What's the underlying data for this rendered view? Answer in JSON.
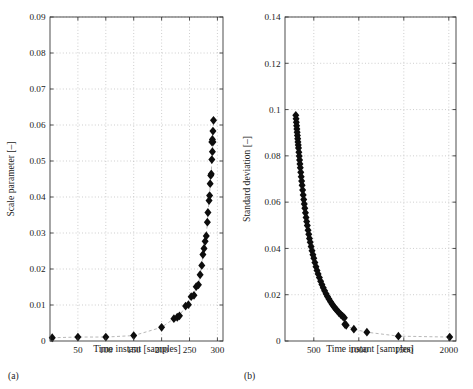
{
  "figure": {
    "background": "#ffffff",
    "marker_color": "#0d0d0d",
    "grid_color": "#b9b9b9",
    "axis_color": "#3a3a3a",
    "connector_color": "#9a9a9a"
  },
  "panels": [
    {
      "id": "a",
      "caption": "(a)",
      "xlabel": "Time instant [samples]",
      "ylabel": "Scale parameter [–]"
    },
    {
      "id": "b",
      "caption": "(b)",
      "xlabel": "Time instant [samples]",
      "ylabel": "Standard deviation [–]"
    }
  ],
  "chart_data": [
    {
      "type": "scatter",
      "id": "panel-a",
      "title": "",
      "subcaption": "(a)",
      "xlabel": "Time instant [samples]",
      "ylabel": "Scale parameter [–]",
      "xlim": [
        0,
        310
      ],
      "ylim": [
        0,
        0.09
      ],
      "xticks": [
        50,
        100,
        150,
        200,
        250,
        300
      ],
      "xtick_labels": [
        "50",
        "100",
        "150",
        "200",
        "250",
        "300"
      ],
      "yticks": [
        0,
        0.01,
        0.02,
        0.03,
        0.04,
        0.05,
        0.06,
        0.07,
        0.08,
        0.09
      ],
      "ytick_labels": [
        "0",
        "0.01",
        "0.02",
        "0.03",
        "0.04",
        "0.05",
        "0.06",
        "0.07",
        "0.08",
        "0.09"
      ],
      "grid": true,
      "legend": null,
      "marker": "diamond",
      "connector": "dashed",
      "series": [
        {
          "name": "Scale parameter",
          "x": [
            4,
            50,
            100,
            150,
            200,
            222,
            228,
            232,
            243,
            248,
            253,
            258,
            262,
            266,
            269,
            272,
            274,
            276,
            278,
            280,
            282,
            283,
            285,
            286,
            287,
            288,
            289,
            290,
            291,
            292
          ],
          "y": [
            0.0009,
            0.0011,
            0.0011,
            0.0015,
            0.0038,
            0.0062,
            0.0066,
            0.007,
            0.0097,
            0.0101,
            0.0123,
            0.0127,
            0.0151,
            0.0156,
            0.0184,
            0.021,
            0.024,
            0.0257,
            0.0277,
            0.0292,
            0.033,
            0.0357,
            0.039,
            0.0404,
            0.0437,
            0.046,
            0.0464,
            0.0504,
            0.0526,
            0.0553
          ]
        },
        {
          "name": "Scale parameter (upper tail)",
          "x": [
            290,
            291,
            292,
            293
          ],
          "y": [
            0.0553,
            0.056,
            0.0583,
            0.0613
          ]
        }
      ]
    },
    {
      "type": "scatter",
      "id": "panel-b",
      "title": "",
      "subcaption": "(b)",
      "xlabel": "Time instant [samples]",
      "ylabel": "Standard deviation [–]",
      "xlim": [
        180,
        2080
      ],
      "ylim": [
        0,
        0.14
      ],
      "xticks": [
        500,
        1000,
        1500,
        2000
      ],
      "xtick_labels": [
        "500",
        "1000",
        "1500",
        "2000"
      ],
      "yticks": [
        0,
        0.02,
        0.04,
        0.06,
        0.08,
        0.1,
        0.12,
        0.14
      ],
      "ytick_labels": [
        "0",
        "0.02",
        "0.04",
        "0.06",
        "0.08",
        "0.1",
        "0.12",
        "0.14"
      ],
      "grid": true,
      "legend": null,
      "marker": "diamond",
      "connector": "dashed",
      "series": [
        {
          "name": "Standard deviation (dense decay)",
          "x": [
            300,
            303,
            306,
            309,
            312,
            315,
            318,
            321,
            324,
            327,
            330,
            334,
            338,
            342,
            346,
            350,
            355,
            360,
            365,
            370,
            376,
            382,
            388,
            394,
            400,
            407,
            414,
            421,
            428,
            436,
            444,
            452,
            460,
            470,
            480,
            490,
            500,
            512,
            524,
            536,
            548,
            562,
            576,
            590,
            605,
            620,
            636,
            652,
            668,
            686,
            704,
            722,
            740,
            760,
            780,
            800,
            820,
            840
          ],
          "y": [
            0.0975,
            0.096,
            0.0945,
            0.093,
            0.0916,
            0.0902,
            0.0888,
            0.0874,
            0.086,
            0.0847,
            0.0834,
            0.0816,
            0.0799,
            0.0782,
            0.0765,
            0.0749,
            0.0729,
            0.071,
            0.0691,
            0.0673,
            0.0652,
            0.0631,
            0.0611,
            0.0592,
            0.0574,
            0.0554,
            0.0534,
            0.0516,
            0.0499,
            0.0479,
            0.0461,
            0.0443,
            0.0427,
            0.0408,
            0.039,
            0.0373,
            0.0358,
            0.0339,
            0.0321,
            0.0305,
            0.029,
            0.0274,
            0.0258,
            0.0244,
            0.023,
            0.0217,
            0.0204,
            0.0192,
            0.0181,
            0.017,
            0.0159,
            0.0149,
            0.014,
            0.0131,
            0.0122,
            0.0114,
            0.0107,
            0.01
          ]
        },
        {
          "name": "Standard deviation (sparse tail)",
          "x": [
            845,
            860,
            945,
            1090,
            1440,
            2010
          ],
          "y": [
            0.0072,
            0.0068,
            0.0051,
            0.0038,
            0.0021,
            0.0017
          ]
        }
      ]
    }
  ]
}
